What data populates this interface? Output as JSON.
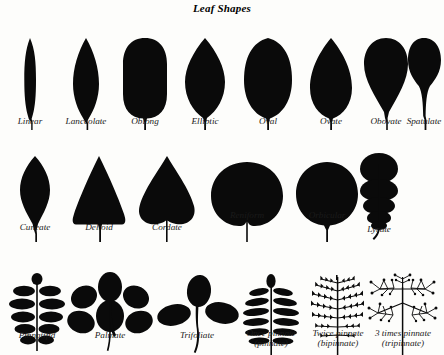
{
  "figure": {
    "title": "Leaf Shapes",
    "background_color": "#fdfdfb",
    "ink_color": "#0a0a0a"
  },
  "rows": [
    {
      "name": "simple-leaf-shapes",
      "items": [
        {
          "label": "Linear",
          "shape": "linear"
        },
        {
          "label": "Lanceolate",
          "shape": "lanceolate"
        },
        {
          "label": "Oblong",
          "shape": "oblong"
        },
        {
          "label": "Elliptic",
          "shape": "elliptic"
        },
        {
          "label": "Oval",
          "shape": "oval"
        },
        {
          "label": "Ovate",
          "shape": "ovate"
        },
        {
          "label": "Obovate",
          "shape": "obovate"
        },
        {
          "label": "Spatulate",
          "shape": "spatulate"
        }
      ]
    },
    {
      "name": "base-and-outline-shapes",
      "items": [
        {
          "label": "Cuneate",
          "shape": "cuneate"
        },
        {
          "label": "Deltoid",
          "shape": "deltoid"
        },
        {
          "label": "Cordate",
          "shape": "cordate"
        },
        {
          "label": "Reniform",
          "shape": "reniform"
        },
        {
          "label": "Orbicular",
          "shape": "orbicular"
        },
        {
          "label": "Lyrate",
          "shape": "lyrate"
        }
      ]
    },
    {
      "name": "divided-and-compound-leaves",
      "items": [
        {
          "label": "Pinnatifid",
          "label2": "",
          "shape": "pinnatifid"
        },
        {
          "label": "Palmate",
          "label2": "",
          "shape": "palmate"
        },
        {
          "label": "Trifoliate",
          "label2": "",
          "shape": "trifoliate"
        },
        {
          "label": "Once pinnate",
          "label2": "(pinnate)",
          "shape": "once-pinnate"
        },
        {
          "label": "Twice pinnate",
          "label2": "(bipinnate)",
          "shape": "twice-pinnate"
        },
        {
          "label": "3 times pinnate",
          "label2": "(tripinnate)",
          "shape": "three-times-pinnate"
        }
      ]
    }
  ]
}
